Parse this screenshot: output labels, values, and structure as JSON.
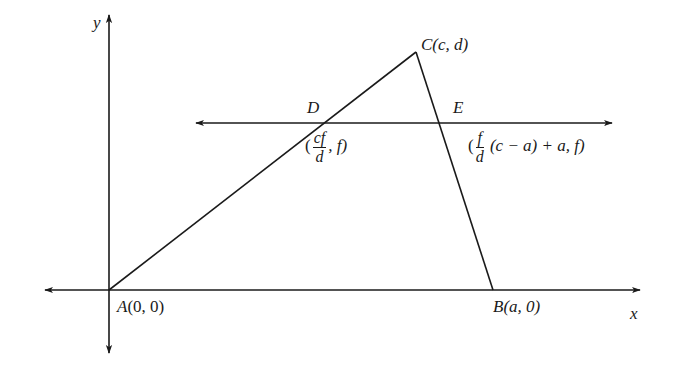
{
  "diagram": {
    "type": "coordinate-geometry",
    "axes": {
      "x_label": "x",
      "y_label": "y"
    },
    "points": {
      "A": {
        "name": "A",
        "coords": "(0, 0)"
      },
      "B": {
        "name": "B",
        "coords": "(a, 0)"
      },
      "C": {
        "name": "C",
        "coords": "(c, d)"
      },
      "D": {
        "name": "D",
        "coords_open": "(",
        "frac_num": "cf",
        "frac_den": "d",
        "coords_rest": ", f)"
      },
      "E": {
        "name": "E",
        "coords_open": "(",
        "frac_num": "f",
        "frac_den": "d",
        "coords_rest": " (c − a) + a, f)"
      }
    },
    "segments": [
      "AC",
      "CB"
    ],
    "lines": [
      "x-axis",
      "y-axis",
      "DE (horizontal line y = f)"
    ],
    "colors": {
      "stroke": "#1a1a1a",
      "background": "#ffffff"
    }
  }
}
